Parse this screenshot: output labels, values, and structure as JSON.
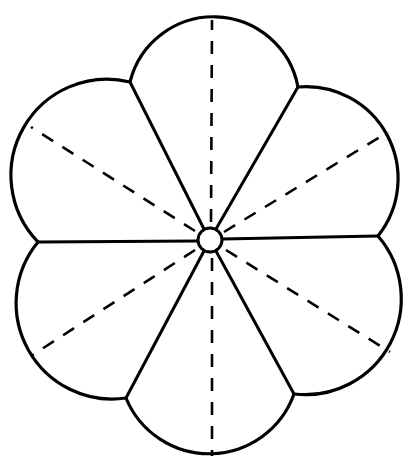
{
  "diagram": {
    "type": "six-petal flower pattern",
    "line_color": "#000000",
    "background": "#ffffff",
    "center": {
      "x": 210,
      "y": 240,
      "radius": 12
    },
    "petal_count": 6,
    "petals": [
      {
        "name": "top",
        "from": [
          130,
          82
        ],
        "to": [
          298,
          87
        ],
        "radius": 86
      },
      {
        "name": "upper-right",
        "from": [
          298,
          87
        ],
        "to": [
          378,
          236
        ],
        "radius": 92
      },
      {
        "name": "lower-right",
        "from": [
          378,
          236
        ],
        "to": [
          294,
          394
        ],
        "radius": 96
      },
      {
        "name": "bottom",
        "from": [
          294,
          394
        ],
        "to": [
          126,
          398
        ],
        "radius": 90
      },
      {
        "name": "lower-left",
        "from": [
          126,
          398
        ],
        "to": [
          38,
          242
        ],
        "radius": 96
      },
      {
        "name": "upper-left",
        "from": [
          38,
          242
        ],
        "to": [
          130,
          82
        ],
        "radius": 96
      }
    ],
    "solid_seams": [
      {
        "to": [
          130,
          82
        ]
      },
      {
        "to": [
          298,
          87
        ]
      },
      {
        "to": [
          378,
          236
        ]
      },
      {
        "to": [
          294,
          394
        ]
      },
      {
        "to": [
          126,
          398
        ]
      },
      {
        "to": [
          38,
          242
        ]
      }
    ],
    "dashed_fold_lines": [
      {
        "to": [
          212,
          20
        ]
      },
      {
        "to": [
          388,
          132
        ]
      },
      {
        "to": [
          390,
          352
        ]
      },
      {
        "to": [
          212,
          456
        ]
      },
      {
        "to": [
          31,
          356
        ]
      },
      {
        "to": [
          31,
          127
        ]
      }
    ]
  }
}
